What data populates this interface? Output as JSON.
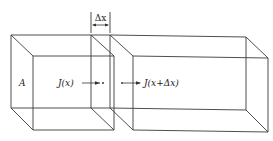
{
  "diagram": {
    "title": "",
    "labels": {
      "area": "A",
      "flux_in": "J(x)",
      "flux_out": "J(x+Δx)",
      "delta_x": "Δx"
    },
    "elements": [
      {
        "id": "left-block",
        "desc": "prism segment from left end to x"
      },
      {
        "id": "slab",
        "desc": "thin slab of thickness Δx between x and x+Δx"
      },
      {
        "id": "right-block",
        "desc": "prism segment from x+Δx to right end"
      }
    ],
    "colors": {
      "line": "#3a3a3a",
      "text": "#222222",
      "background": "#ffffff"
    }
  }
}
